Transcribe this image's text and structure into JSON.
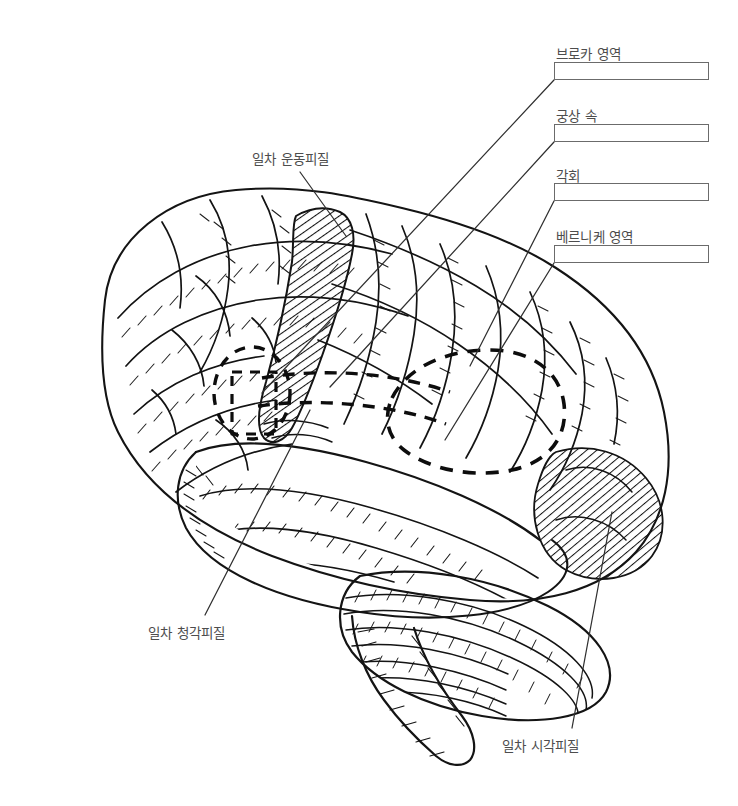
{
  "figure": {
    "view": "좌측면 대뇌반구",
    "style": "pen-and-ink line drawing",
    "background_color": "#ffffff",
    "ink_color": "#1a1a1a",
    "text_color": "#4d4d4d",
    "box_border_color": "#6b6b6b"
  },
  "callout_labels": [
    {
      "id": "brocas-area",
      "label": "브로카 영역",
      "label_x": 556,
      "label_y": 46,
      "box": {
        "x": 554,
        "y": 62,
        "w": 155,
        "h": 18
      },
      "has_answer_box": true,
      "leader_from": [
        554,
        80
      ],
      "leader_to": [
        262,
        393
      ],
      "target": "왼쪽 점선 영역 (하전두회)"
    },
    {
      "id": "arcuate-fasciculus",
      "label": "궁상 속",
      "label_x": 556,
      "label_y": 108,
      "box": {
        "x": 554,
        "y": 124,
        "w": 155,
        "h": 18
      },
      "has_answer_box": true,
      "leader_from": [
        554,
        142
      ],
      "leader_to": [
        330,
        387
      ],
      "target": "브로카와 베르니케를 잇는 점선 띠"
    },
    {
      "id": "angular-gyrus",
      "label": "각회",
      "label_x": 556,
      "label_y": 168,
      "box": {
        "x": 554,
        "y": 183,
        "w": 155,
        "h": 18
      },
      "has_answer_box": true,
      "leader_from": [
        554,
        201
      ],
      "leader_to": [
        470,
        366
      ],
      "target": "모이랑 (각회)"
    },
    {
      "id": "wernickes-area",
      "label": "베르니케 영역",
      "label_x": 556,
      "label_y": 229,
      "box": {
        "x": 554,
        "y": 245,
        "w": 155,
        "h": 18
      },
      "has_answer_box": true,
      "leader_from": [
        554,
        263
      ],
      "leader_to": [
        445,
        440
      ],
      "target": "오른쪽 큰 점선 영역 (상측두회 후부)"
    },
    {
      "id": "primary-motor-cortex",
      "label": "일차 운동피질",
      "label_x": 252,
      "label_y": 151,
      "has_answer_box": false,
      "leader_from": [
        300,
        172
      ],
      "leader_to": [
        346,
        236
      ],
      "target": "빗금친 중심전회"
    },
    {
      "id": "primary-auditory-cortex",
      "label": "일차 청각피질",
      "label_x": 148,
      "label_y": 625,
      "has_answer_box": false,
      "leader_from": [
        205,
        615
      ],
      "leader_to": [
        310,
        410
      ],
      "target": "상측두회 (헤슬회)"
    },
    {
      "id": "primary-visual-cortex",
      "label": "일차 시각피질",
      "label_x": 502,
      "label_y": 738,
      "has_answer_box": false,
      "leader_from": [
        572,
        728
      ],
      "leader_to": [
        612,
        512
      ],
      "target": "빗금친 후두엽"
    }
  ],
  "shaded_regions": [
    {
      "id": "motor-strip",
      "name": "중심전회 빗금 영역",
      "pattern": "diagonal-hatch"
    },
    {
      "id": "occipital-patch",
      "name": "후두엽 빗금 영역",
      "pattern": "diagonal-hatch"
    }
  ],
  "dashed_regions": [
    {
      "id": "broca-outline",
      "name": "브로카 영역 점선 윤곽"
    },
    {
      "id": "arcuate-band",
      "name": "궁상 속 점선 띠"
    },
    {
      "id": "wernicke-outline",
      "name": "베르니케 영역 점선 윤곽"
    }
  ]
}
